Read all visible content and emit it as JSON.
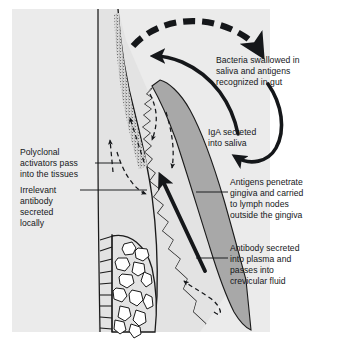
{
  "figure": {
    "domain_note": "anatomical cross-section diagram of tooth, gingiva and alveolar bone",
    "background_color": "#ffffff",
    "field_color": "#ebebeb",
    "tissue_color": "#e3e3e3",
    "gingiva_color": "#a8a8a8",
    "plaque_color": "#9a9a9a",
    "bone_space_color": "#ffffff",
    "ink_color": "#15171a"
  },
  "labels": {
    "bacteria_swallowed": {
      "name": "bacteria-swallowed-label",
      "lines": [
        "Bacteria swallowed in",
        "saliva and antigens",
        "recognized in gut"
      ]
    },
    "iga_secreted": {
      "name": "iga-secreted-label",
      "lines": [
        "IgA secreted",
        "into saliva"
      ]
    },
    "polyclonal_activators": {
      "name": "polyclonal-activators-label",
      "lines": [
        "Polyclonal",
        "activators pass",
        "into the tissues"
      ]
    },
    "irrelevant_antibody": {
      "name": "irrelevant-antibody-label",
      "lines": [
        "Irrelevant",
        "antibody",
        "secreted",
        "locally"
      ]
    },
    "antigens_penetrate": {
      "name": "antigens-penetrate-label",
      "lines": [
        "Antigens penetrate",
        "gingiva and carried",
        "to lymph nodes",
        "outside the gingiva"
      ]
    },
    "antibody_secreted": {
      "name": "antibody-secreted-label",
      "lines": [
        "Antibody secreted",
        "into plasma and",
        "passes into",
        "crevicular fluid"
      ]
    }
  },
  "structures": {
    "tooth": "tooth-crown-and-root",
    "plaque": "dental-plaque-stipple",
    "gingiva": "gingival-epithelium",
    "connective_tissue": "connective-tissue",
    "alveolar_bone": "alveolar-bone-trabeculae",
    "pdl": "periodontal-ligament-fibers"
  },
  "arrows": {
    "dashed_thick_arc": "bacteria-to-gut-arrow",
    "solid_arc_left": "antigen-recognition-return-arrow",
    "solid_arc_right": "iga-to-saliva-arrow",
    "thick_diagonal": "antibody-to-crevicular-fluid-arrow",
    "dashed_up_left": "polyclonal-activator-arrow",
    "dashed_down_right": "antigen-penetration-arrow",
    "dashed_loop_left": "irrelevant-antibody-loop-arrow",
    "dashed_loop_bottom": "plasma-antibody-loop-arrow"
  }
}
